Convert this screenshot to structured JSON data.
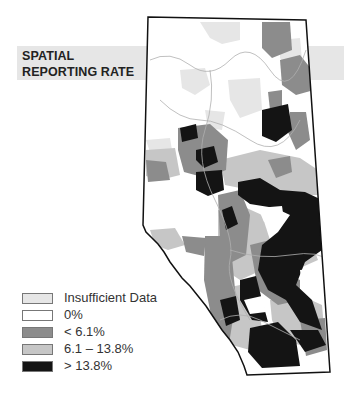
{
  "title": {
    "line1": "SPATIAL",
    "line2": "REPORTING RATE"
  },
  "colors": {
    "insufficient": "#e6e6e6",
    "zero": "#ffffff",
    "low": "#8c8c8c",
    "mid": "#c6c6c6",
    "high": "#141414",
    "band": "#e6e6e6",
    "outline": "#111111"
  },
  "legend": {
    "items": [
      {
        "label": "Insufficient Data",
        "color": "#e6e6e6"
      },
      {
        "label": "0%",
        "color": "#ffffff"
      },
      {
        "label": "< 6.1%",
        "color": "#8c8c8c"
      },
      {
        "label": "6.1 – 13.8%",
        "color": "#c6c6c6"
      },
      {
        "label": "> 13.8%",
        "color": "#141414"
      }
    ]
  }
}
